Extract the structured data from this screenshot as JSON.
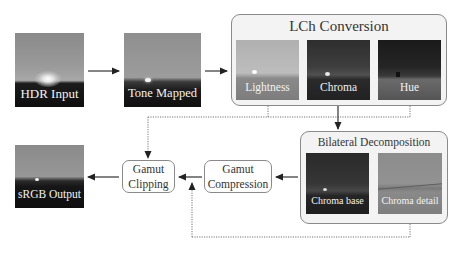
{
  "inputs": {
    "hdr_input": {
      "label": "HDR Input"
    },
    "tone_mapped": {
      "label": "Tone Mapped"
    },
    "srgb_output": {
      "label": "sRGB Output"
    }
  },
  "lch_group": {
    "title": "LCh Conversion",
    "channels": [
      {
        "label": "Lightness"
      },
      {
        "label": "Chroma"
      },
      {
        "label": "Hue"
      }
    ]
  },
  "bilateral_group": {
    "title": "Bilateral Decomposition",
    "channels": [
      {
        "label": "Chroma base"
      },
      {
        "label": "Chroma detail"
      }
    ]
  },
  "nodes": {
    "gamut_clipping": {
      "line1": "Gamut",
      "line2": "Clipping"
    },
    "gamut_compression": {
      "line1": "Gamut",
      "line2": "Compression"
    }
  },
  "colors": {
    "group_fill": "#f3f3f3",
    "border": "#8a8a8a",
    "arrow": "#222222"
  }
}
